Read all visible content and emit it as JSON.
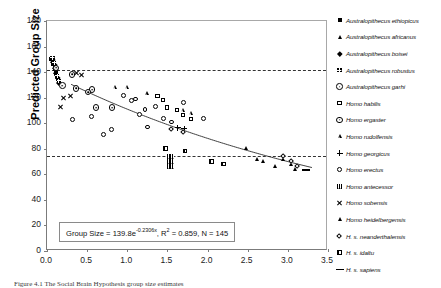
{
  "chart_data": {
    "type": "scatter",
    "title": "",
    "xlabel": "",
    "ylabel": "Predicted Group Size",
    "xlim": [
      0.0,
      3.5
    ],
    "ylim": [
      0,
      180
    ],
    "xticks": [
      "0.0",
      "0.5",
      "1.0",
      "1.5",
      "2.0",
      "2.5",
      "3.0",
      "3.5"
    ],
    "yticks": [
      "0",
      "20",
      "40",
      "60",
      "80",
      "100",
      "120",
      "140",
      "160",
      "180"
    ],
    "grid": false,
    "legend_position": "right",
    "annotation": {
      "equation_prefix": "Group Size = 139.8e",
      "exponent": "-0.2306x",
      "r_squared_label": ", R",
      "r_squared_sup": "2",
      "r_squared_value": " = 0.859",
      "n_label": ", N = 145"
    },
    "fit": {
      "type": "exponential",
      "coefficient": 139.8,
      "rate": -0.2306,
      "r_squared": 0.859,
      "n": 145
    },
    "reference_lines": [
      {
        "name": "upper-dashed-reference",
        "y": 142,
        "style": "dashed"
      },
      {
        "name": "lower-dashed-reference",
        "y": 74,
        "style": "dashed"
      }
    ],
    "series": [
      {
        "name": "Australopithecus ethiopicus",
        "marker": "m-sq-f",
        "points": [
          [
            0.08,
            146
          ],
          [
            0.1,
            143
          ],
          [
            0.12,
            139
          ],
          [
            0.06,
            150
          ],
          [
            0.14,
            134
          ]
        ]
      },
      {
        "name": "Australopithecus africanus",
        "marker": "m-tri-f",
        "points": [
          [
            0.09,
            144
          ],
          [
            0.11,
            140
          ],
          [
            0.13,
            136
          ],
          [
            0.07,
            148
          ],
          [
            0.15,
            132
          ],
          [
            0.1,
            142
          ],
          [
            0.12,
            138
          ]
        ]
      },
      {
        "name": "Australopithecus boisei",
        "marker": "m-dia-f",
        "points": [
          [
            0.1,
            145
          ],
          [
            0.12,
            141
          ],
          [
            0.08,
            149
          ],
          [
            0.14,
            135
          ],
          [
            0.16,
            131
          ]
        ]
      },
      {
        "name": "Australopithecus robustus",
        "marker": "m-sq-grid",
        "points": [
          [
            0.09,
            147
          ],
          [
            0.11,
            143
          ],
          [
            0.13,
            137
          ],
          [
            0.07,
            151
          ],
          [
            0.15,
            133
          ]
        ]
      },
      {
        "name": "Australopithecus garhi",
        "marker": "m-cir-dot",
        "points": [
          [
            0.1,
            144
          ],
          [
            0.3,
            139
          ],
          [
            0.55,
            127
          ],
          [
            0.6,
            113
          ],
          [
            0.8,
            113
          ]
        ]
      },
      {
        "name": "Homo habilis",
        "marker": "m-sq-o",
        "points": [
          [
            1.45,
            118
          ],
          [
            1.5,
            112
          ],
          [
            1.62,
            110
          ],
          [
            1.7,
            106
          ],
          [
            1.8,
            103
          ],
          [
            1.38,
            121
          ]
        ]
      },
      {
        "name": "Homo ergaster",
        "marker": "m-cir-dot",
        "points": [
          [
            0.18,
            130
          ],
          [
            0.35,
            128
          ],
          [
            0.5,
            125
          ]
        ]
      },
      {
        "name": "Homo rudolfensis",
        "marker": "m-tri-o",
        "points": [
          [
            0.85,
            128
          ],
          [
            1.0,
            128
          ],
          [
            1.25,
            123
          ],
          [
            1.7,
            110
          ],
          [
            1.8,
            108
          ]
        ]
      },
      {
        "name": "Homo georgicus",
        "marker": "m-plus",
        "points": [
          [
            1.62,
            97
          ],
          [
            1.7,
            96
          ]
        ]
      },
      {
        "name": "Homo erectus",
        "marker": "m-cir-o",
        "points": [
          [
            0.32,
            103
          ],
          [
            0.55,
            105
          ],
          [
            0.7,
            91
          ],
          [
            0.8,
            95
          ],
          [
            1.05,
            118
          ],
          [
            1.15,
            107
          ],
          [
            1.25,
            97
          ],
          [
            1.35,
            113
          ],
          [
            1.45,
            104
          ],
          [
            1.55,
            101
          ],
          [
            1.7,
            116
          ],
          [
            1.95,
            104
          ],
          [
            0.95,
            122
          ],
          [
            1.1,
            119
          ],
          [
            1.22,
            111
          ]
        ]
      },
      {
        "name": "Homo antecessor",
        "marker": "m-sq-hatch",
        "points": [
          [
            1.52,
            74
          ],
          [
            1.52,
            70
          ],
          [
            1.52,
            66
          ],
          [
            1.56,
            74
          ],
          [
            1.56,
            70
          ],
          [
            1.56,
            66
          ]
        ]
      },
      {
        "name": "Homo sobensis",
        "marker": "m-x",
        "points": [
          [
            0.2,
            120
          ],
          [
            0.28,
            122
          ],
          [
            0.36,
            140
          ],
          [
            0.42,
            138
          ],
          [
            0.16,
            113
          ]
        ]
      },
      {
        "name": "Homo heidelbergensis",
        "marker": "m-tri-f",
        "points": [
          [
            2.48,
            80
          ],
          [
            2.62,
            72
          ],
          [
            2.7,
            70
          ],
          [
            2.95,
            72
          ],
          [
            3.05,
            68
          ],
          [
            3.1,
            64
          ],
          [
            2.85,
            66
          ]
        ]
      },
      {
        "name": "H. s. neanderthalensis",
        "marker": "m-dia-dot",
        "points": [
          [
            1.55,
            95
          ],
          [
            1.7,
            93
          ],
          [
            2.95,
            74
          ],
          [
            3.05,
            70
          ],
          [
            3.12,
            66
          ]
        ]
      },
      {
        "name": "H. s. idaltu",
        "marker": "m-sq-half",
        "points": [
          [
            1.48,
            80
          ],
          [
            1.72,
            78
          ],
          [
            2.05,
            70
          ],
          [
            2.2,
            68
          ]
        ]
      },
      {
        "name": "H. s. sapiens",
        "marker": "m-dash",
        "points": [
          [
            3.2,
            62
          ]
        ]
      }
    ]
  },
  "legend": {
    "items": [
      {
        "label": "Australopithecus ethiopicus",
        "marker": "m-sq-f"
      },
      {
        "label": "Australopithecus africanus",
        "marker": "m-tri-f"
      },
      {
        "label": "Australopithecus boisei",
        "marker": "m-dia-f"
      },
      {
        "label": "Australopithecus robustus",
        "marker": "m-sq-grid"
      },
      {
        "label": "Australopithecus garhi",
        "marker": "m-cir-dot"
      },
      {
        "label": "Homo habilis",
        "marker": "m-sq-o"
      },
      {
        "label": "Homo ergaster",
        "marker": "m-cir-dot"
      },
      {
        "label": "Homo rudolfensis",
        "marker": "m-tri-o"
      },
      {
        "label": "Homo georgicus",
        "marker": "m-plus"
      },
      {
        "label": "Homo erectus",
        "marker": "m-cir-o"
      },
      {
        "label": "Homo antecessor",
        "marker": "m-sq-hatch"
      },
      {
        "label": "Homo sobensis",
        "marker": "m-x"
      },
      {
        "label": "Homo heidelbergensis",
        "marker": "m-tri-f"
      },
      {
        "label": "H. s. neanderthalensis",
        "marker": "m-dia-dot"
      },
      {
        "label": "H. s. idaltu",
        "marker": "m-sq-half"
      },
      {
        "label": "H. s. sapiens",
        "marker": "m-dash"
      }
    ]
  },
  "caption": {
    "text": "Figure 4.1 The Social Brain Hypothesis group size estimates"
  }
}
